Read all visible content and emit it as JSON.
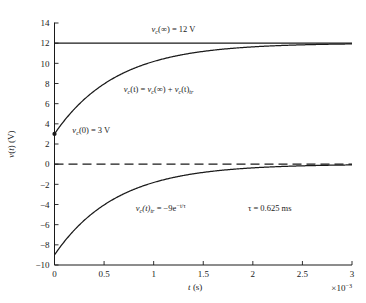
{
  "chart_data": {
    "type": "line",
    "title": "",
    "xlabel": "t (s)",
    "ylabel": "v(t) (V)",
    "x_multiplier_label": "×10⁻³",
    "xlim": [
      0,
      3
    ],
    "ylim": [
      -10,
      14
    ],
    "xticks": [
      0,
      0.5,
      1,
      1.5,
      2,
      2.5,
      3
    ],
    "xtick_labels": [
      "0",
      "0.5",
      "1",
      "1.5",
      "2",
      "2.5",
      "3"
    ],
    "yticks": [
      -10,
      -8,
      -6,
      -4,
      -2,
      0,
      2,
      4,
      6,
      8,
      10,
      12,
      14
    ],
    "ytick_labels": [
      "-10",
      "-8",
      "-6",
      "-4",
      "-2",
      "0",
      "2",
      "4",
      "6",
      "8",
      "10",
      "12",
      "14"
    ],
    "grid": false,
    "legend": "none",
    "time_unit_ms": 1,
    "tau_ms": 0.625,
    "series": [
      {
        "name": "steady-state asymptote",
        "style": "solid",
        "kind": "constant",
        "value": 12,
        "x_start": 0,
        "x_end": 3
      },
      {
        "name": "zero reference",
        "style": "dashed",
        "kind": "constant",
        "value": 0,
        "x_start": 0,
        "x_end": 3
      },
      {
        "name": "capacitor voltage v_c(t)",
        "style": "solid",
        "kind": "exponential_rise",
        "final": 12,
        "initial": 3,
        "amplitude": -9,
        "tau": 0.625,
        "x_start": 0,
        "x_end": 3
      },
      {
        "name": "transient response v_c(t)_tr",
        "style": "solid",
        "kind": "exponential_decay",
        "final": 0,
        "initial": -9,
        "amplitude": -9,
        "tau": 0.625,
        "x_start": 0,
        "x_end": 3
      }
    ],
    "markers": [
      {
        "name": "initial-voltage-marker",
        "x": 0,
        "y": 3
      }
    ],
    "vertical_lines": [
      {
        "name": "t-zero-line",
        "x": 0,
        "y_from": -10,
        "y_to": 12,
        "style": "dashed"
      }
    ],
    "annotations": {
      "steady_state": {
        "text_parts": {
          "v": "v",
          "sub": "c",
          "arg": "(∞) = 12 V"
        },
        "x": 1.2,
        "y": 13.1
      },
      "total_response": {
        "text_parts": {
          "v": "v",
          "sub": "c",
          "mid": "(t) = ",
          "v2": "v",
          "sub2": "c",
          "mid2": "(∞) + ",
          "v3": "v",
          "sub3": "c",
          "tail": "(t)",
          "sub4": "tr"
        },
        "x": 1.05,
        "y": 7.2
      },
      "initial_value": {
        "text_parts": {
          "v": "v",
          "sub": "c",
          "arg": "(0) = 3 V"
        },
        "x": 0.18,
        "y": 3.1
      },
      "transient": {
        "text_parts": {
          "v": "v",
          "sub": "c",
          "mid": "(t)",
          "sub2": "tr",
          "eq": " = −9e",
          "sup": "−t/τ"
        },
        "x": 0.82,
        "y": -4.6
      },
      "tau_value": {
        "text": "τ = 0.625 ms",
        "x": 1.95,
        "y": -4.6
      }
    }
  }
}
